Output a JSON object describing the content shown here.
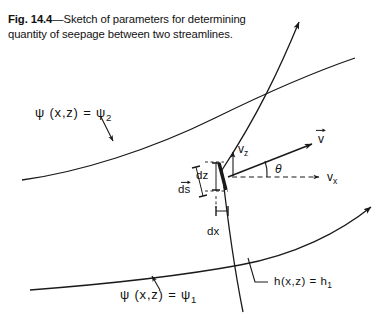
{
  "caption": {
    "figure_number": "Fig. 14.4",
    "dash": "—",
    "text": "Sketch of parameters for determining quantity of seepage between two streamlines."
  },
  "labels": {
    "upper_streamline": {
      "func": "ψ (x,z) =",
      "value": "ψ",
      "subscript": "2"
    },
    "lower_streamline": {
      "func": "ψ (x,z) =",
      "value": "ψ",
      "subscript": "1"
    },
    "equipotential": {
      "func": "h(x,z) =",
      "value": "h",
      "subscript": "1"
    },
    "velocity_vector": "v",
    "velocity_x": {
      "symbol": "v",
      "subscript": "x"
    },
    "velocity_z": {
      "symbol": "v",
      "subscript": "z"
    },
    "angle": "θ",
    "element_ds": "ds",
    "element_dz": "dz",
    "element_dx": "dx"
  },
  "colors": {
    "ink": "#1a1a1a",
    "background": "#ffffff"
  }
}
